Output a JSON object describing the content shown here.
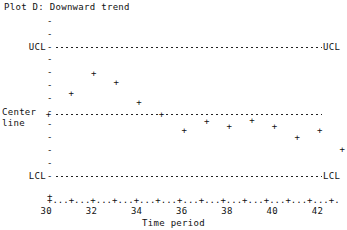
{
  "chart_data": {
    "type": "scatter",
    "title": "Plot D: Downward trend",
    "xlabel": "Time period",
    "ylabel": "",
    "xlim": [
      30,
      43
    ],
    "x": [
      30,
      31,
      32,
      33,
      34,
      35,
      36,
      37,
      38,
      39,
      40,
      41,
      42,
      43
    ],
    "values": [
      0.0,
      0.9,
      1.8,
      1.4,
      0.5,
      0.0,
      -0.75,
      -0.35,
      -0.55,
      -0.3,
      -0.55,
      -1.05,
      -0.75,
      -1.6
    ],
    "point_marker": "+",
    "grid": false,
    "legend": null,
    "reference_lines": [
      {
        "name": "UCL",
        "label_left": "UCL",
        "label_right": "UCL",
        "value": 3.0,
        "style": "dashed"
      },
      {
        "name": "Center line",
        "label_left": "Center\nline",
        "label_right": "",
        "value": 0.0,
        "style": "dashed"
      },
      {
        "name": "LCL",
        "label_left": "LCL",
        "label_right": "LCL",
        "value": -3.0,
        "style": "dashed"
      }
    ],
    "xtick_labels": [
      "30",
      "32",
      "34",
      "36",
      "38",
      "40",
      "42"
    ],
    "xtick_values": [
      30,
      32,
      34,
      36,
      38,
      40,
      42
    ],
    "x_axis_ascii": "+...+...+...+...+...+...+...+...+...+...+...+...+...+.",
    "ytick_marker": "-",
    "y_axis_center_marker": "+"
  },
  "labels": {
    "ucl_left": "UCL",
    "ucl_right": "UCL",
    "center_line_1": "Center",
    "center_line_2": "line",
    "lcl_left": "LCL",
    "lcl_right": "LCL"
  }
}
